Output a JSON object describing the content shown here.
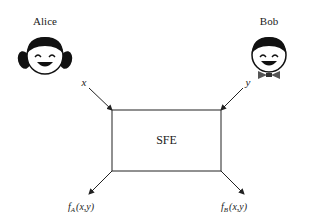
{
  "diagram": {
    "parties": [
      {
        "name": "Alice",
        "icon": "girl-face-icon"
      },
      {
        "name": "Bob",
        "icon": "boy-face-bowtie-icon"
      }
    ],
    "box": {
      "label": "SFE"
    },
    "inputs": {
      "alice": "x",
      "bob": "y"
    },
    "outputs": {
      "alice": {
        "f": "f",
        "sub": "A",
        "args": "(x,y)"
      },
      "bob": {
        "f": "f",
        "sub": "B",
        "args": "(x,y)"
      }
    },
    "colors": {
      "stroke": "#222222",
      "background": "#ffffff"
    }
  }
}
